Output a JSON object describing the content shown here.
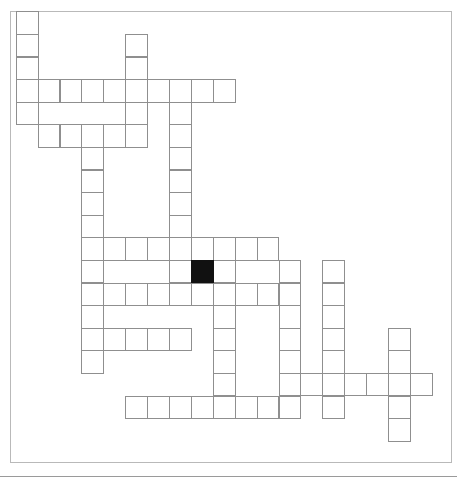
{
  "puzzle": {
    "title_visible": "",
    "grid": {
      "origin_x": 15.7,
      "origin_y": 11.3,
      "cell_w": 21.9,
      "cell_h": 22.6,
      "rows": 19,
      "cols": 19,
      "colors": {
        "cell_fill": "#ffffff",
        "cell_border": "#8f8f8f",
        "block_fill": "#111111",
        "board_border": "#b9b9b9"
      },
      "white_cells": [
        [
          0,
          0
        ],
        [
          1,
          0
        ],
        [
          1,
          5
        ],
        [
          2,
          0
        ],
        [
          2,
          5
        ],
        [
          3,
          0
        ],
        [
          3,
          1
        ],
        [
          3,
          2
        ],
        [
          3,
          3
        ],
        [
          3,
          4
        ],
        [
          3,
          5
        ],
        [
          3,
          6
        ],
        [
          3,
          7
        ],
        [
          3,
          8
        ],
        [
          3,
          9
        ],
        [
          4,
          0
        ],
        [
          4,
          5
        ],
        [
          4,
          7
        ],
        [
          5,
          1
        ],
        [
          5,
          2
        ],
        [
          5,
          3
        ],
        [
          5,
          4
        ],
        [
          5,
          5
        ],
        [
          5,
          7
        ],
        [
          6,
          3
        ],
        [
          6,
          7
        ],
        [
          7,
          3
        ],
        [
          7,
          7
        ],
        [
          8,
          3
        ],
        [
          8,
          7
        ],
        [
          9,
          3
        ],
        [
          9,
          7
        ],
        [
          10,
          3
        ],
        [
          10,
          4
        ],
        [
          10,
          5
        ],
        [
          10,
          6
        ],
        [
          10,
          7
        ],
        [
          10,
          8
        ],
        [
          10,
          9
        ],
        [
          10,
          10
        ],
        [
          10,
          11
        ],
        [
          11,
          3
        ],
        [
          11,
          7
        ],
        [
          11,
          9
        ],
        [
          11,
          12
        ],
        [
          11,
          14
        ],
        [
          12,
          3
        ],
        [
          12,
          4
        ],
        [
          12,
          5
        ],
        [
          12,
          6
        ],
        [
          12,
          7
        ],
        [
          12,
          8
        ],
        [
          12,
          9
        ],
        [
          12,
          10
        ],
        [
          12,
          11
        ],
        [
          12,
          12
        ],
        [
          12,
          14
        ],
        [
          13,
          3
        ],
        [
          13,
          9
        ],
        [
          13,
          12
        ],
        [
          13,
          14
        ],
        [
          14,
          3
        ],
        [
          14,
          4
        ],
        [
          14,
          5
        ],
        [
          14,
          6
        ],
        [
          14,
          7
        ],
        [
          14,
          9
        ],
        [
          14,
          12
        ],
        [
          14,
          14
        ],
        [
          14,
          17
        ],
        [
          15,
          3
        ],
        [
          15,
          9
        ],
        [
          15,
          12
        ],
        [
          15,
          14
        ],
        [
          15,
          17
        ],
        [
          16,
          9
        ],
        [
          16,
          12
        ],
        [
          16,
          13
        ],
        [
          16,
          14
        ],
        [
          16,
          15
        ],
        [
          16,
          16
        ],
        [
          16,
          17
        ],
        [
          16,
          18
        ],
        [
          17,
          5
        ],
        [
          17,
          6
        ],
        [
          17,
          7
        ],
        [
          17,
          8
        ],
        [
          17,
          9
        ],
        [
          17,
          10
        ],
        [
          17,
          11
        ],
        [
          17,
          12
        ],
        [
          17,
          14
        ],
        [
          17,
          17
        ],
        [
          18,
          17
        ]
      ],
      "black_cells": [
        [
          11,
          8
        ]
      ]
    }
  }
}
